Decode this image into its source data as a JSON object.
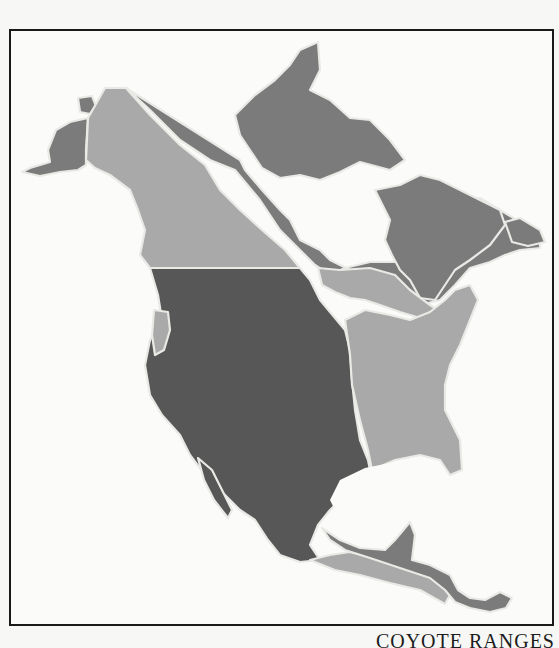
{
  "caption": "COYOTE RANGES",
  "map": {
    "subject": "North America coyote subspecies ranges",
    "colors": {
      "background": "#fbfbf9",
      "frame": "#1a1a1a",
      "range_dark": "#575757",
      "range_medium": "#7b7b7b",
      "range_light": "#a9a9a9",
      "boundary": "#e9e9e6"
    },
    "regions": [
      {
        "id": "alaska-arctic",
        "shade": "medium",
        "area": "Alaska and Arctic Canada"
      },
      {
        "id": "northwest-canada",
        "shade": "light",
        "area": "Yukon / Northwest Canada"
      },
      {
        "id": "eastern-canada",
        "shade": "medium",
        "area": "Quebec / Labrador"
      },
      {
        "id": "central-canada",
        "shade": "light",
        "area": "Ontario / Prairie corridor"
      },
      {
        "id": "western-us-mexico",
        "shade": "dark",
        "area": "Western United States and Mexico"
      },
      {
        "id": "pacific-northwest",
        "shade": "light",
        "area": "Pacific Northwest coast"
      },
      {
        "id": "eastern-us",
        "shade": "light",
        "area": "Eastern United States"
      },
      {
        "id": "southern-mexico",
        "shade": "light",
        "area": "Southern Mexico coast"
      },
      {
        "id": "central-america",
        "shade": "medium",
        "area": "Yucatan and Central America"
      }
    ]
  }
}
